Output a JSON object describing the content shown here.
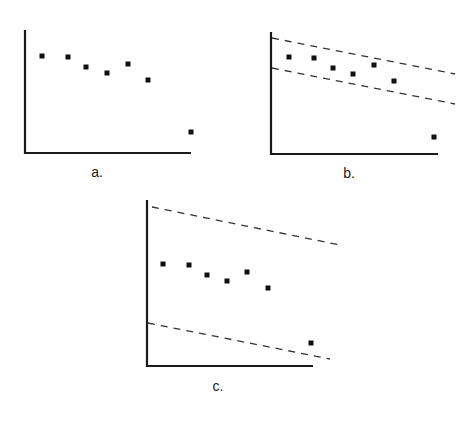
{
  "figure": {
    "colors": {
      "axis": "#1a1a1a",
      "points": "#111111",
      "dashed": "#333333",
      "background": "#ffffff"
    }
  },
  "panels": [
    {
      "label": "a.",
      "axes": {
        "x0": 25,
        "y0": 153,
        "x1": 191,
        "ytop": 30
      },
      "bands": [],
      "points": [
        [
          42,
          56
        ],
        [
          68,
          57
        ],
        [
          86,
          67
        ],
        [
          107,
          73
        ],
        [
          128,
          64
        ],
        [
          148,
          80
        ],
        [
          191,
          132
        ]
      ],
      "label_pos": [
        97,
        177
      ]
    },
    {
      "label": "b.",
      "axes": {
        "x0": 271,
        "y0": 154,
        "x1": 438,
        "ytop": 32
      },
      "bands": [
        {
          "x1": 272,
          "y1": 38,
          "x2": 455,
          "y2": 74
        },
        {
          "x1": 272,
          "y1": 68,
          "x2": 455,
          "y2": 104
        }
      ],
      "points": [
        [
          289,
          57
        ],
        [
          314,
          58
        ],
        [
          333,
          68
        ],
        [
          353,
          74
        ],
        [
          374,
          65
        ],
        [
          394,
          81
        ],
        [
          434,
          137
        ]
      ],
      "label_pos": [
        349,
        178
      ]
    },
    {
      "label": "c.",
      "axes": {
        "x0": 147,
        "y0": 366,
        "x1": 313,
        "ytop": 200
      },
      "bands": [
        {
          "x1": 152,
          "y1": 207,
          "x2": 340,
          "y2": 245
        },
        {
          "x1": 148,
          "y1": 323,
          "x2": 330,
          "y2": 359
        }
      ],
      "points": [
        [
          163,
          264
        ],
        [
          189,
          265
        ],
        [
          207,
          275
        ],
        [
          227,
          281
        ],
        [
          247,
          272
        ],
        [
          268,
          288
        ],
        [
          311,
          343
        ]
      ],
      "label_pos": [
        218,
        391
      ]
    }
  ],
  "chart_data": [
    {
      "type": "scatter",
      "title": "a.",
      "x": [
        1,
        2,
        3,
        4,
        5,
        6,
        8
      ],
      "y": [
        7.9,
        7.8,
        7.0,
        6.5,
        7.2,
        5.9,
        1.7
      ],
      "bands": [],
      "xlabel": "",
      "ylabel": "",
      "grid": false,
      "legend": null
    },
    {
      "type": "scatter",
      "title": "b.",
      "x": [
        1,
        2,
        3,
        4,
        5,
        6,
        8
      ],
      "y": [
        7.9,
        7.8,
        7.0,
        6.5,
        7.2,
        5.9,
        1.7
      ],
      "bands": [
        "narrow dashed band enclosing first six points, excluding outlier"
      ],
      "xlabel": "",
      "ylabel": "",
      "grid": false,
      "legend": null
    },
    {
      "type": "scatter",
      "title": "c.",
      "x": [
        1,
        2,
        3,
        4,
        5,
        6,
        8
      ],
      "y": [
        7.9,
        7.8,
        7.0,
        6.5,
        7.2,
        5.9,
        1.7
      ],
      "bands": [
        "wide dashed band enclosing all seven points"
      ],
      "xlabel": "",
      "ylabel": "",
      "grid": false,
      "legend": null
    }
  ]
}
